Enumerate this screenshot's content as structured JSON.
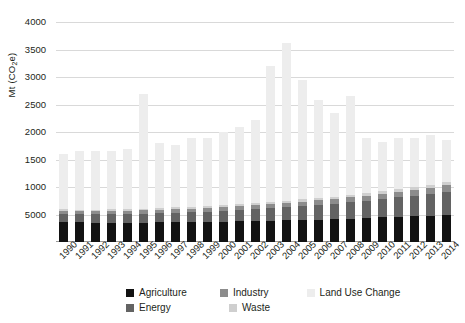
{
  "chart_data": {
    "type": "bar",
    "stacked": true,
    "title": "",
    "xlabel": "",
    "ylabel": "Mt (CO2e)",
    "ylabel_rich": {
      "prefix": "Mt (CO",
      "sub": "2",
      "suffix": "e)"
    },
    "ylim": [
      0,
      4000
    ],
    "ytick_values": [
      500,
      1000,
      1500,
      2000,
      2500,
      3000,
      3500,
      4000
    ],
    "ytick_labels": [
      "5000",
      "1000",
      "1500",
      "2000",
      "2500",
      "3000",
      "3500",
      "4000"
    ],
    "grid": true,
    "grid_axis": "y",
    "legend_position": "bottom",
    "categories": [
      "1990",
      "1991",
      "1992",
      "1993",
      "1994",
      "1995",
      "1996",
      "1997",
      "1998",
      "1999",
      "2000",
      "2001",
      "2002",
      "2003",
      "2004",
      "2005",
      "2006",
      "2007",
      "2008",
      "2009",
      "2010",
      "2011",
      "2012",
      "2013",
      "2014"
    ],
    "series": [
      {
        "name": "Agriculture",
        "color": "#121212",
        "values": [
          360,
          355,
          350,
          350,
          345,
          350,
          355,
          360,
          360,
          365,
          370,
          375,
          380,
          390,
          395,
          400,
          405,
          415,
          425,
          435,
          450,
          460,
          470,
          480,
          495
        ]
      },
      {
        "name": "Energy",
        "color": "#636363",
        "values": [
          150,
          150,
          155,
          155,
          160,
          165,
          170,
          175,
          180,
          190,
          200,
          210,
          220,
          230,
          240,
          250,
          265,
          280,
          295,
          310,
          330,
          350,
          370,
          390,
          420
        ]
      },
      {
        "name": "Industry",
        "color": "#8c8c8c",
        "values": [
          55,
          55,
          55,
          58,
          58,
          60,
          62,
          64,
          66,
          68,
          70,
          72,
          75,
          78,
          80,
          83,
          86,
          90,
          94,
          98,
          102,
          106,
          110,
          114,
          120
        ]
      },
      {
        "name": "Waste",
        "color": "#cfcfcf",
        "values": [
          30,
          30,
          30,
          31,
          31,
          32,
          33,
          33,
          34,
          35,
          36,
          37,
          38,
          39,
          40,
          41,
          42,
          43,
          44,
          45,
          46,
          47,
          48,
          49,
          50
        ]
      },
      {
        "name": "Land Use Change",
        "color": "#ededed",
        "values": [
          1005,
          1060,
          1060,
          1056,
          1106,
          2093,
          1173,
          1133,
          1260,
          1242,
          1324,
          1406,
          1507,
          2463,
          2865,
          2176,
          1777,
          1521,
          1795,
          1012,
          892,
          937,
          902,
          917,
          765
        ]
      }
    ],
    "totals": [
      1600,
      1650,
      1650,
      1650,
      1700,
      2700,
      1750,
      1700,
      1900,
      1900,
      2000,
      2100,
      2220,
      3600,
      3820,
      3050,
      2575,
      2349,
      2653,
      1900,
      1820,
      1900,
      1900,
      1950,
      1850
    ]
  },
  "legend": {
    "items": [
      {
        "label": "Agriculture",
        "swatch_name": "legend-swatch-agriculture",
        "color": "#121212"
      },
      {
        "label": "Industry",
        "swatch_name": "legend-swatch-industry",
        "color": "#8c8c8c"
      },
      {
        "label": "Land Use Change",
        "swatch_name": "legend-swatch-land-use-change",
        "color": "#ededed"
      },
      {
        "label": "Energy",
        "swatch_name": "legend-swatch-energy",
        "color": "#636363"
      },
      {
        "label": "Waste",
        "swatch_name": "legend-swatch-waste",
        "color": "#cfcfcf"
      }
    ]
  },
  "colors": {
    "background": "#ffffff",
    "gridline": "#d9d9d9",
    "axis": "#9a9a9a",
    "text": "#231f20"
  }
}
